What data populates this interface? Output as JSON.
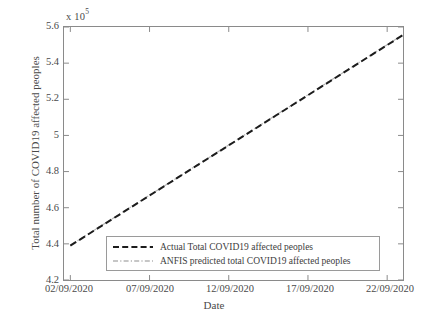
{
  "chart_data": {
    "type": "line",
    "title": "",
    "xlabel": "Date",
    "ylabel": "Total number of COVID19 affected peoples",
    "y_multiplier_text": "x 10",
    "y_multiplier_exponent": "5",
    "y_multiplier_value": 100000,
    "ylim": [
      4.2,
      5.6
    ],
    "yticks": [
      "4.2",
      "4.4",
      "4.6",
      "4.8",
      "5",
      "5.2",
      "5.4",
      "5.6"
    ],
    "ytick_values": [
      4.2,
      4.4,
      4.6,
      4.8,
      5.0,
      5.2,
      5.4,
      5.6
    ],
    "xticks": [
      "02/09/2020",
      "07/09/2020",
      "12/09/2020",
      "17/09/2020",
      "22/09/2020"
    ],
    "xtick_values": [
      0,
      5,
      10,
      15,
      20
    ],
    "xlim": [
      -0.4,
      21.0
    ],
    "grid": false,
    "legend_position": "lower center",
    "x": [
      0,
      1,
      2,
      3,
      4,
      5,
      6,
      7,
      8,
      9,
      10,
      11,
      12,
      13,
      14,
      15,
      16,
      17,
      18,
      19,
      20,
      21
    ],
    "x_dates": [
      "02/09/2020",
      "03/09/2020",
      "04/09/2020",
      "05/09/2020",
      "06/09/2020",
      "07/09/2020",
      "08/09/2020",
      "09/09/2020",
      "10/09/2020",
      "11/09/2020",
      "12/09/2020",
      "13/09/2020",
      "14/09/2020",
      "15/09/2020",
      "16/09/2020",
      "17/09/2020",
      "18/09/2020",
      "19/09/2020",
      "20/09/2020",
      "21/09/2020",
      "22/09/2020",
      "23/09/2020"
    ],
    "series": [
      {
        "name": "Actual Total COVID19 affected peoples",
        "style": "dashed",
        "color": "#1c1c1c",
        "width": 2.0,
        "values": [
          4.39,
          4.4455,
          4.501,
          4.5565,
          4.612,
          4.6675,
          4.723,
          4.7785,
          4.834,
          4.8895,
          4.945,
          5.0005,
          5.056,
          5.1115,
          5.167,
          5.2225,
          5.278,
          5.3335,
          5.389,
          5.4445,
          5.5,
          5.5555
        ]
      },
      {
        "name": "ANFIS predicted total COVID19 affected peoples",
        "style": "dash-dot",
        "color": "#b4b4b4",
        "width": 1.2,
        "values": [
          4.392,
          4.4475,
          4.503,
          4.5585,
          4.614,
          4.6695,
          4.725,
          4.7805,
          4.836,
          4.8915,
          4.947,
          5.0025,
          5.058,
          5.1135,
          5.169,
          5.2245,
          5.28,
          5.3355,
          5.391,
          5.4465,
          5.502,
          5.5575
        ]
      }
    ]
  },
  "legend": {
    "entries": [
      {
        "label": "Actual Total COVID19 affected peoples",
        "sample_name": "legend-sample-actual"
      },
      {
        "label": "ANFIS predicted total COVID19 affected peoples",
        "sample_name": "legend-sample-anfis"
      }
    ]
  },
  "colors": {
    "background": "#ffffff",
    "axis": "#8a8a8a",
    "text": "#4a4a4a",
    "actual_line": "#1c1c1c",
    "anfis_line": "#b4b4b4",
    "legend_border": "#9a9a9a"
  }
}
